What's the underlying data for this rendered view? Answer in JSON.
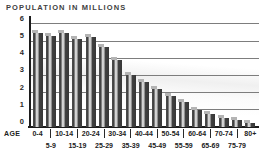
{
  "title": "POPULATION IN MILLIONS",
  "axis": {
    "age_label": "AGE"
  },
  "colors": {
    "bar_dark": "#3d3d3d",
    "bar_highlight": "#d0d0d0",
    "bar_cap": "#b4b4b4",
    "gridline": "#7d7d7d",
    "axis": "#1c1c1c",
    "text": "#2a2a2a",
    "background": "#ffffff"
  },
  "chart_data": {
    "type": "bar",
    "title": "POPULATION IN MILLIONS",
    "xlabel": "AGE",
    "ylabel": "POPULATION IN MILLIONS",
    "ylim": [
      0,
      6
    ],
    "yticks": [
      0,
      1,
      2,
      3,
      4,
      5,
      6
    ],
    "grid": true,
    "legend": "none",
    "categories": [
      "0-4",
      "5-9",
      "10-14",
      "15-19",
      "20-24",
      "25-29",
      "30-34",
      "35-39",
      "40-44",
      "45-49",
      "50-54",
      "55-59",
      "60-64",
      "65-69",
      "70-74",
      "75-79",
      "80+"
    ],
    "values": [
      5.5,
      5.3,
      5.45,
      5.1,
      5.25,
      4.65,
      3.9,
      3.05,
      2.6,
      2.2,
      1.8,
      1.45,
      1.0,
      0.75,
      0.55,
      0.4,
      0.25
    ],
    "x_label_top_row": [
      "0-4",
      "10-14",
      "20-24",
      "30-34",
      "40-44",
      "50-54",
      "60-64",
      "70-74",
      "80+"
    ],
    "x_label_bottom_row": [
      "5-9",
      "15-19",
      "25-29",
      "35-39",
      "45-49",
      "55-59",
      "65-69",
      "75-79"
    ]
  }
}
